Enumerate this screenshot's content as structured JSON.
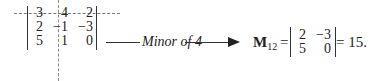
{
  "matrix": {
    "rows": [
      [
        "3",
        "4",
        "2"
      ],
      [
        "2",
        "−1",
        "−3"
      ],
      [
        "5",
        "1",
        "0"
      ]
    ],
    "struck_row": 0,
    "struck_col": 1
  },
  "annotation": {
    "label": "Minor of 4"
  },
  "minor": {
    "symbol": "M",
    "subscript": "12",
    "equals": "=",
    "rows": [
      [
        "2",
        "−3"
      ],
      [
        "5",
        "0"
      ]
    ],
    "result": "= 15."
  }
}
